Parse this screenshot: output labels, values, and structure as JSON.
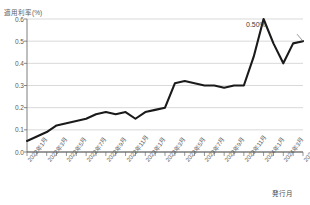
{
  "chart": {
    "title": "",
    "y_axis_title": "適用利率(%)",
    "x_axis_title": "発行月",
    "annotation_label": "0.50%",
    "line_color": "#1a1a1a",
    "grid_color": "#c9c9c9",
    "axis_color": "#7f7f7f"
  },
  "chart_data": {
    "type": "line",
    "title": "",
    "xlabel": "発行月",
    "ylabel": "適用利率(%)",
    "ylim": [
      0.0,
      0.6
    ],
    "yticks": [
      "0.0",
      "0.1",
      "0.2",
      "0.3",
      "0.4",
      "0.5",
      "0.6"
    ],
    "ytick_values": [
      0.0,
      0.1,
      0.2,
      0.3,
      0.4,
      0.5,
      0.6
    ],
    "grid": true,
    "legend": "none",
    "categories": [
      "2022年1月",
      "2022年2月",
      "2022年3月",
      "2022年4月",
      "2022年5月",
      "2022年6月",
      "2022年7月",
      "2022年8月",
      "2022年9月",
      "2022年10月",
      "2022年11月",
      "2022年12月",
      "2023年1月",
      "2023年2月",
      "2023年3月",
      "2023年4月",
      "2023年5月",
      "2023年6月",
      "2023年7月",
      "2023年8月",
      "2023年9月",
      "2023年10月",
      "2023年11月",
      "2023年12月",
      "2024年1月",
      "2024年2月",
      "2024年3月",
      "2024年4月",
      "2024年5月"
    ],
    "xtick_labels": [
      "2022年1月",
      "2022年3月",
      "2022年5月",
      "2022年7月",
      "2022年9月",
      "2022年11月",
      "2023年1月",
      "2023年3月",
      "2023年5月",
      "2023年7月",
      "2023年9月",
      "2023年11月",
      "2024年1月",
      "2024年3月",
      "2024年5月"
    ],
    "xtick_indices": [
      0,
      2,
      4,
      6,
      8,
      10,
      12,
      14,
      16,
      18,
      20,
      22,
      24,
      26,
      28
    ],
    "values": [
      0.05,
      0.07,
      0.09,
      0.12,
      0.13,
      0.14,
      0.15,
      0.17,
      0.18,
      0.17,
      0.18,
      0.15,
      0.18,
      0.19,
      0.2,
      0.31,
      0.32,
      0.31,
      0.3,
      0.3,
      0.29,
      0.3,
      0.3,
      0.43,
      0.6,
      0.49,
      0.4,
      0.49,
      0.5
    ],
    "annotations": [
      {
        "label": "0.50%",
        "index": 28,
        "value": 0.5
      }
    ]
  }
}
